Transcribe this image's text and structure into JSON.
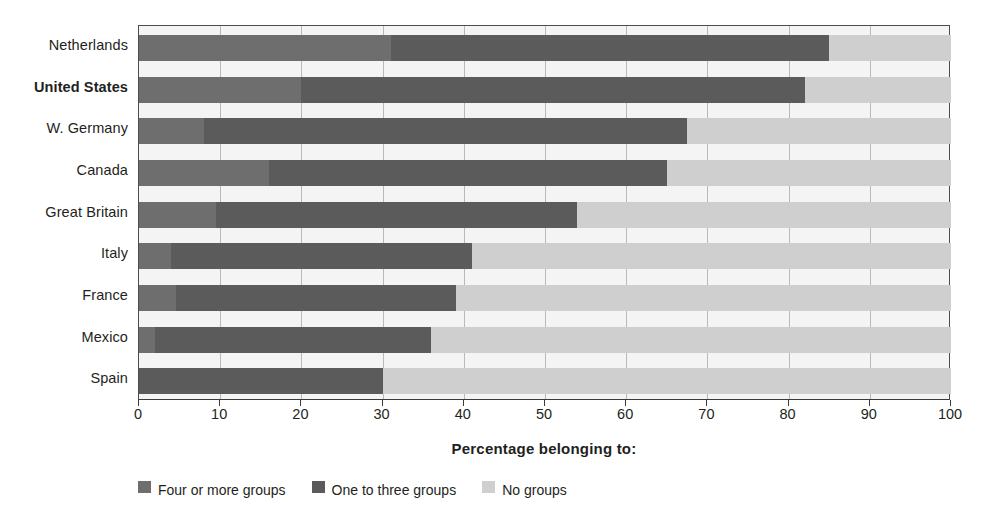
{
  "chart_data": {
    "type": "bar",
    "orientation": "horizontal",
    "stacked": true,
    "stacked_mode": "percent",
    "title": "",
    "xlabel": "Percentage belonging to:",
    "ylabel": "",
    "xlim": [
      0,
      100
    ],
    "xticks": [
      0,
      10,
      20,
      30,
      40,
      50,
      60,
      70,
      80,
      90,
      100
    ],
    "xticklabels": [
      "0",
      "10",
      "20",
      "30",
      "40",
      "50",
      "60",
      "70",
      "80",
      "90",
      "100"
    ],
    "grid": true,
    "grid_axis": "x",
    "legend_position": "bottom",
    "categories": [
      "Netherlands",
      "United States",
      "W. Germany",
      "Canada",
      "Great Britain",
      "Italy",
      "France",
      "Mexico",
      "Spain"
    ],
    "highlighted_category": "United States",
    "series": [
      {
        "name": "Four or more groups",
        "color": "#6e6e6e",
        "values": [
          31,
          20,
          8,
          16,
          9.5,
          4,
          4.5,
          2,
          0
        ]
      },
      {
        "name": "One to three groups",
        "color": "#5b5b5b",
        "values": [
          54,
          62,
          59.5,
          49,
          44.5,
          37,
          34.5,
          34,
          30
        ]
      },
      {
        "name": "No groups",
        "color": "#cfcfcf",
        "values": [
          15,
          18,
          32.5,
          35,
          46,
          59,
          61,
          64,
          70
        ]
      }
    ],
    "cumulative_boundaries": [
      [
        31,
        85
      ],
      [
        20,
        82
      ],
      [
        8,
        67.5
      ],
      [
        16,
        65
      ],
      [
        9.5,
        54
      ],
      [
        4,
        41
      ],
      [
        4.5,
        39
      ],
      [
        2,
        36
      ],
      [
        0,
        30
      ]
    ]
  },
  "axis": {
    "x_title": "Percentage belonging to:"
  },
  "legend": {
    "items": [
      {
        "label": "Four or more groups",
        "swatch": "legend-swatch-four-or-more"
      },
      {
        "label": "One to three groups",
        "swatch": "legend-swatch-one-to-three"
      },
      {
        "label": "No groups",
        "swatch": "legend-swatch-no-groups"
      }
    ]
  },
  "colors": {
    "series_four_or_more": "#6e6e6e",
    "series_one_to_three": "#5b5b5b",
    "series_no_groups": "#cfcfcf",
    "plot_background": "#f4f4f4",
    "axis": "#3a3a3a",
    "gridline": "#b9b9b9",
    "text": "#231f20"
  }
}
